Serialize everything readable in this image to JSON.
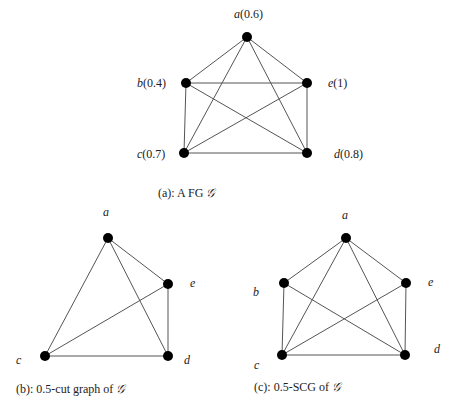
{
  "figures": [
    {
      "id": "a",
      "caption": "(a): A  FG ",
      "caption_symbol": "𝒢",
      "nodes": [
        {
          "id": "a",
          "label": "a",
          "value": "(0.6)",
          "x": 247,
          "y": 37,
          "lx": 234,
          "ly": 18
        },
        {
          "id": "b",
          "label": "b",
          "value": "(0.4)",
          "x": 186,
          "y": 83,
          "lx": 137,
          "ly": 87
        },
        {
          "id": "e",
          "label": "e",
          "value": "(1)",
          "x": 307,
          "y": 83,
          "lx": 328,
          "ly": 87
        },
        {
          "id": "c",
          "label": "c",
          "value": "(0.7)",
          "x": 184,
          "y": 153,
          "lx": 137,
          "ly": 158
        },
        {
          "id": "d",
          "label": "d",
          "value": "(0.8)",
          "x": 307,
          "y": 153,
          "lx": 334,
          "ly": 158
        }
      ],
      "edges": [
        [
          "a",
          "b"
        ],
        [
          "a",
          "e"
        ],
        [
          "a",
          "c"
        ],
        [
          "a",
          "d"
        ],
        [
          "b",
          "e"
        ],
        [
          "b",
          "c"
        ],
        [
          "b",
          "d"
        ],
        [
          "e",
          "c"
        ],
        [
          "e",
          "d"
        ],
        [
          "c",
          "d"
        ]
      ]
    },
    {
      "id": "b",
      "caption": "(b): 0.5-cut graph of ",
      "caption_symbol": "𝒢",
      "nodes": [
        {
          "id": "a",
          "label": "a",
          "x": 108,
          "y": 238,
          "lx": 103,
          "ly": 216
        },
        {
          "id": "e",
          "label": "e",
          "x": 168,
          "y": 284,
          "lx": 190,
          "ly": 287
        },
        {
          "id": "c",
          "label": "c",
          "x": 45,
          "y": 356,
          "lx": 16,
          "ly": 364
        },
        {
          "id": "d",
          "label": "d",
          "x": 168,
          "y": 356,
          "lx": 184,
          "ly": 364
        }
      ],
      "edges": [
        [
          "a",
          "c"
        ],
        [
          "a",
          "d"
        ],
        [
          "a",
          "e"
        ],
        [
          "e",
          "c"
        ],
        [
          "e",
          "d"
        ],
        [
          "c",
          "d"
        ]
      ]
    },
    {
      "id": "c",
      "caption": "(c): 0.5-SCG of ",
      "caption_symbol": "𝒢",
      "nodes": [
        {
          "id": "a",
          "label": "a",
          "x": 346,
          "y": 238,
          "lx": 342,
          "ly": 219
        },
        {
          "id": "b",
          "label": "b",
          "x": 284,
          "y": 283,
          "lx": 253,
          "ly": 296
        },
        {
          "id": "e",
          "label": "e",
          "x": 406,
          "y": 283,
          "lx": 428,
          "ly": 286
        },
        {
          "id": "c",
          "label": "c",
          "x": 282,
          "y": 355,
          "lx": 254,
          "ly": 369
        },
        {
          "id": "d",
          "label": "d",
          "x": 405,
          "y": 355,
          "lx": 434,
          "ly": 353
        }
      ],
      "edges": [
        [
          "a",
          "b"
        ],
        [
          "a",
          "e"
        ],
        [
          "a",
          "c"
        ],
        [
          "a",
          "d"
        ],
        [
          "b",
          "c"
        ],
        [
          "b",
          "d"
        ],
        [
          "e",
          "c"
        ],
        [
          "e",
          "d"
        ],
        [
          "c",
          "d"
        ]
      ]
    }
  ],
  "captions": {
    "a": {
      "text": "(a): A  FG ",
      "symbol": "𝒢",
      "x": 158,
      "y": 197
    },
    "b": {
      "text": "(b): 0.5-cut graph of ",
      "symbol": "𝒢",
      "x": 16,
      "y": 393
    },
    "c": {
      "text": "(c): 0.5-SCG of ",
      "symbol": "𝒢",
      "x": 254,
      "y": 391
    }
  }
}
